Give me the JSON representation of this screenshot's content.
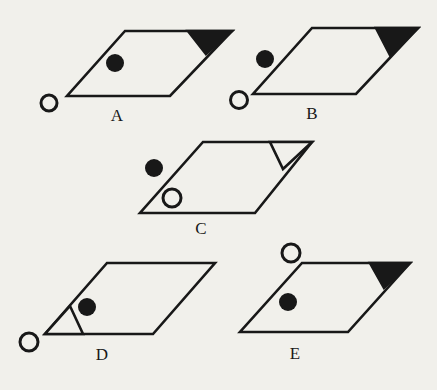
{
  "figure": {
    "background_color": "#f1f0eb",
    "line_color": "#181818",
    "stroke_width": 2.6,
    "dot_stroke_width": 3,
    "label_font_size": 17,
    "shapes": [
      {
        "label": "A",
        "parallelogram": [
          [
            125,
            31
          ],
          [
            232,
            31
          ],
          [
            170,
            96
          ],
          [
            67,
            96
          ]
        ],
        "corner_triangle": {
          "corner": "top-right",
          "style": "black",
          "points": [
            [
              188,
              31
            ],
            [
              232,
              31
            ],
            [
              206,
              54
            ]
          ]
        },
        "filled_dot": {
          "cx": 115,
          "cy": 63,
          "r": 9
        },
        "open_dot": {
          "cx": 49,
          "cy": 103,
          "r": 8
        },
        "label_position": [
          117,
          121
        ]
      },
      {
        "label": "B",
        "parallelogram": [
          [
            312,
            28
          ],
          [
            418,
            28
          ],
          [
            356,
            94
          ],
          [
            253,
            94
          ]
        ],
        "corner_triangle": {
          "corner": "top-right",
          "style": "black",
          "points": [
            [
              376,
              28
            ],
            [
              418,
              28
            ],
            [
              390,
              55
            ]
          ]
        },
        "filled_dot": {
          "cx": 265,
          "cy": 59,
          "r": 9
        },
        "open_dot": {
          "cx": 239,
          "cy": 100,
          "r": 8.5
        },
        "label_position": [
          312,
          119
        ]
      },
      {
        "label": "C",
        "parallelogram": [
          [
            203,
            142
          ],
          [
            312,
            142
          ],
          [
            255,
            213
          ],
          [
            140,
            213
          ]
        ],
        "corner_triangle": {
          "corner": "top-right",
          "style": "outline",
          "points": [
            [
              270,
              142
            ],
            [
              312,
              142
            ],
            [
              283,
              169
            ]
          ]
        },
        "filled_dot": {
          "cx": 154,
          "cy": 168,
          "r": 9
        },
        "open_dot": {
          "cx": 172,
          "cy": 198,
          "r": 9
        },
        "label_position": [
          201,
          234
        ]
      },
      {
        "label": "D",
        "parallelogram": [
          [
            107,
            263
          ],
          [
            215,
            263
          ],
          [
            153,
            334
          ],
          [
            45,
            334
          ]
        ],
        "corner_triangle": {
          "corner": "bottom-left",
          "style": "outline",
          "points": [
            [
              70,
              306
            ],
            [
              83,
              334
            ],
            [
              45,
              334
            ]
          ]
        },
        "filled_dot": {
          "cx": 87,
          "cy": 307,
          "r": 9
        },
        "open_dot": {
          "cx": 29,
          "cy": 342,
          "r": 9
        },
        "label_position": [
          102,
          360
        ]
      },
      {
        "label": "E",
        "parallelogram": [
          [
            302,
            263
          ],
          [
            410,
            263
          ],
          [
            348,
            332
          ],
          [
            240,
            332
          ]
        ],
        "corner_triangle": {
          "corner": "top-right",
          "style": "black",
          "points": [
            [
              370,
              263
            ],
            [
              410,
              263
            ],
            [
              384,
              288
            ]
          ]
        },
        "filled_dot": {
          "cx": 288,
          "cy": 302,
          "r": 9
        },
        "open_dot": {
          "cx": 291,
          "cy": 253,
          "r": 9
        },
        "label_position": [
          295,
          359
        ]
      }
    ]
  }
}
